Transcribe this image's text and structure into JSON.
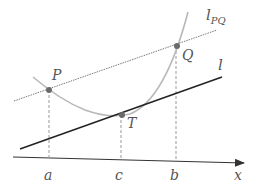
{
  "diagram": {
    "labels": {
      "P": "P",
      "Q": "Q",
      "T": "T",
      "a": "a",
      "b": "b",
      "c": "c",
      "x": "x",
      "l": "l",
      "l_PQ_main": "l",
      "l_PQ_sub": "PQ"
    },
    "colors": {
      "curve": "#b8b8b8",
      "secant": "#7a7a7a",
      "tangent": "#222222",
      "axis": "#333333",
      "dashed": "#999999",
      "points": "#6a6a6a",
      "labels": "#555555"
    },
    "points": [
      {
        "name": "P",
        "x": 49,
        "y": 90
      },
      {
        "name": "Q",
        "x": 177,
        "y": 46
      },
      {
        "name": "T",
        "x": 122,
        "y": 115
      }
    ]
  }
}
